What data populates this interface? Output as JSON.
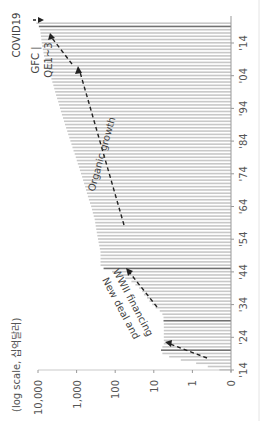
{
  "chart_data": {
    "type": "bar",
    "orientation": "rotated-90-ccw",
    "title": "",
    "unit_label": "(log scale, 십억달러)",
    "xlabel": "",
    "ylabel": "(log scale, 십억달러)",
    "y_scale": "log",
    "y_ticks": [
      "0",
      "1",
      "10",
      "100",
      "1,000",
      "10,000"
    ],
    "y_tick_values": [
      0.1,
      1,
      10,
      100,
      1000,
      10000
    ],
    "ylim": [
      0.1,
      10000
    ],
    "x_ticks": [
      "'14",
      "'24",
      "'34",
      "'44",
      "'54",
      "'64",
      "'74",
      "'84",
      "'94",
      "'04",
      "'14"
    ],
    "x_tick_years": [
      1914,
      1924,
      1934,
      1944,
      1954,
      1964,
      1974,
      1984,
      1994,
      2004,
      2014
    ],
    "x_range": [
      1914,
      2020
    ],
    "bar_color": "#c8c8c8",
    "highlight_color": "#707070",
    "highlight_years": [
      1920,
      1929,
      1945,
      2019
    ],
    "series": [
      {
        "name": "Fed balance sheet",
        "x": [
          1914,
          1915,
          1916,
          1917,
          1918,
          1919,
          1920,
          1921,
          1922,
          1923,
          1924,
          1925,
          1926,
          1927,
          1928,
          1929,
          1930,
          1931,
          1932,
          1933,
          1934,
          1935,
          1936,
          1937,
          1938,
          1939,
          1940,
          1941,
          1942,
          1943,
          1944,
          1945,
          1946,
          1947,
          1948,
          1949,
          1950,
          1951,
          1952,
          1953,
          1954,
          1955,
          1956,
          1957,
          1958,
          1959,
          1960,
          1961,
          1962,
          1963,
          1964,
          1965,
          1966,
          1967,
          1968,
          1969,
          1970,
          1971,
          1972,
          1973,
          1974,
          1975,
          1976,
          1977,
          1978,
          1979,
          1980,
          1981,
          1982,
          1983,
          1984,
          1985,
          1986,
          1987,
          1988,
          1989,
          1990,
          1991,
          1992,
          1993,
          1994,
          1995,
          1996,
          1997,
          1998,
          1999,
          2000,
          2001,
          2002,
          2003,
          2004,
          2005,
          2006,
          2007,
          2008,
          2009,
          2010,
          2011,
          2012,
          2013,
          2014,
          2015,
          2016,
          2017,
          2018,
          2019,
          2020
        ],
        "values": [
          0.2,
          0.4,
          0.8,
          2,
          4,
          6,
          6.5,
          6,
          5.5,
          5.5,
          5.5,
          5.5,
          5.5,
          5.5,
          5.5,
          5.6,
          5.6,
          6,
          7,
          9,
          11,
          13,
          15,
          18,
          20,
          24,
          30,
          38,
          55,
          80,
          120,
          200,
          240,
          240,
          240,
          240,
          240,
          250,
          260,
          270,
          280,
          290,
          300,
          310,
          320,
          330,
          340,
          360,
          380,
          400,
          420,
          450,
          480,
          510,
          540,
          570,
          600,
          640,
          680,
          720,
          770,
          820,
          870,
          930,
          990,
          1050,
          1120,
          1200,
          1280,
          1360,
          1450,
          1550,
          1650,
          1750,
          1870,
          2000,
          2120,
          2250,
          2400,
          2550,
          2700,
          2850,
          3000,
          3200,
          3400,
          3600,
          3800,
          4000,
          4250,
          4500,
          4750,
          5000,
          5250,
          5500,
          6000,
          6500,
          7000,
          7200,
          7500,
          7800,
          8000,
          8200,
          8400,
          8600,
          8800,
          9500,
          11000
        ]
      }
    ],
    "annotations": [
      {
        "text": "COVID19",
        "year": 2020
      },
      {
        "text": "GFC |",
        "year": 2008
      },
      {
        "text": "QE1~3",
        "year": 2010
      },
      {
        "text": "Organic growth",
        "range": [
          1955,
          2007
        ]
      },
      {
        "text": "New deal and",
        "range": [
          1933,
          1945
        ]
      },
      {
        "text": "WWII financing",
        "range": [
          1933,
          1945
        ]
      }
    ],
    "grid": false,
    "legend": "none"
  }
}
